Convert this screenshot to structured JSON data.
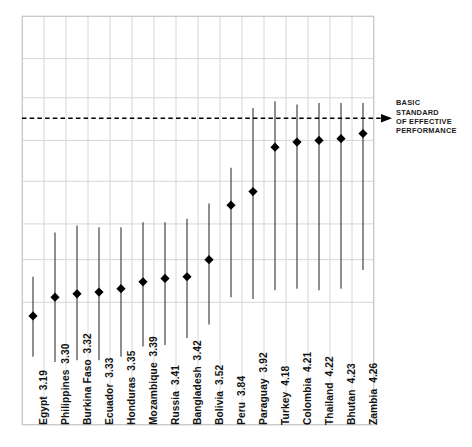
{
  "chart_data": {
    "type": "scatter",
    "title": "",
    "subtitle": "",
    "xlabel": "",
    "ylabel": "",
    "grid": true,
    "legend_position": "none",
    "ylim": [
      2.55,
      4.95
    ],
    "y_gridlines": [
      4.95,
      4.7,
      4.47,
      4.22,
      3.98,
      3.73,
      3.52,
      3.27,
      2.55
    ],
    "categories": [
      "Egypt",
      "Philippines",
      "Burkina Faso",
      "Ecuador",
      "Honduras",
      "Mozambique",
      "Russia",
      "Bangladesh",
      "Bolivia",
      "Peru",
      "Paraguay",
      "Turkey",
      "Colombia",
      "Thailand",
      "Bhutan",
      "Zambia"
    ],
    "values": [
      3.19,
      3.3,
      3.32,
      3.33,
      3.35,
      3.39,
      3.41,
      3.42,
      3.52,
      3.84,
      3.92,
      4.18,
      4.21,
      4.22,
      4.23,
      4.26
    ],
    "error_low": [
      2.95,
      2.92,
      2.93,
      2.93,
      2.95,
      3.01,
      3.02,
      3.06,
      3.14,
      3.3,
      3.29,
      3.34,
      3.35,
      3.34,
      3.35,
      3.46
    ],
    "error_high": [
      3.42,
      3.68,
      3.72,
      3.71,
      3.71,
      3.74,
      3.74,
      3.76,
      3.85,
      4.06,
      4.41,
      4.45,
      4.43,
      4.44,
      4.44,
      4.44
    ],
    "tick_labels": [
      {
        "name": "Egypt",
        "value": "3.19"
      },
      {
        "name": "Philippines",
        "value": "3.30"
      },
      {
        "name": "Burkina Faso",
        "value": "3.32"
      },
      {
        "name": "Ecuador",
        "value": "3.33"
      },
      {
        "name": "Honduras",
        "value": "3.35"
      },
      {
        "name": "Mozambique",
        "value": "3.39"
      },
      {
        "name": "Russia",
        "value": "3.41"
      },
      {
        "name": "Bangladesh",
        "value": "3.42"
      },
      {
        "name": "Bolivia",
        "value": "3.52"
      },
      {
        "name": "Peru",
        "value": "3.84"
      },
      {
        "name": "Paraguay",
        "value": "3.92"
      },
      {
        "name": "Turkey",
        "value": "4.18"
      },
      {
        "name": "Colombia",
        "value": "4.21"
      },
      {
        "name": "Thailand",
        "value": "4.22"
      },
      {
        "name": "Bhutan",
        "value": "4.23"
      },
      {
        "name": "Zambia",
        "value": "4.26"
      }
    ],
    "reference_line": {
      "value": 4.35,
      "style": "dashed",
      "arrow": "right",
      "label_lines": [
        "BASIC",
        "STANDARD",
        "OF EFFECTIVE",
        "PERFORMANCE"
      ],
      "label_text": "BASIC STANDARD OF EFFECTIVE PERFORMANCE"
    },
    "colors": {
      "marker": "#000000",
      "whisker": "#333333",
      "grid": "#d6d6d6",
      "frame": "#c9c9c9",
      "reference_line": "#000000",
      "text": "#121212"
    }
  }
}
